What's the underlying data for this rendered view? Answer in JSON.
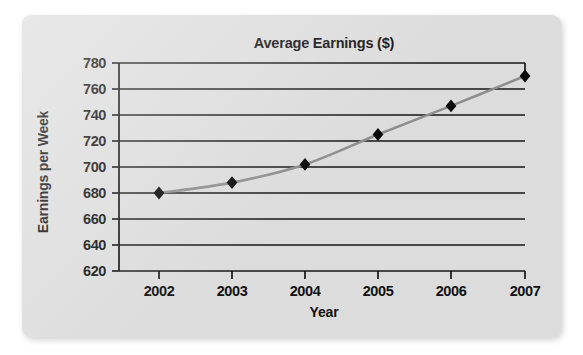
{
  "chart_data": {
    "type": "line",
    "title": "Average Earnings ($)",
    "xlabel": "Year",
    "ylabel": "Earnings per Week",
    "categories": [
      "2002",
      "2003",
      "2004",
      "2005",
      "2006",
      "2007"
    ],
    "x": [
      2002,
      2003,
      2004,
      2005,
      2006,
      2007
    ],
    "values": [
      680,
      688,
      702,
      725,
      747,
      770
    ],
    "series": [
      {
        "name": "Earnings per Week",
        "values": [
          680,
          688,
          702,
          725,
          747,
          770
        ]
      }
    ],
    "ylim": [
      620,
      780
    ],
    "yticks": [
      620,
      640,
      660,
      680,
      700,
      720,
      740,
      760,
      780
    ],
    "ytick_labels": [
      "620",
      "640",
      "660",
      "680",
      "700",
      "720",
      "740",
      "760",
      "780"
    ],
    "xtick_labels": [
      "2002",
      "2003",
      "2004",
      "2005",
      "2006",
      "2007"
    ],
    "grid": true,
    "grid_axis": "y",
    "legend": false,
    "legend_position": "none",
    "marker": "diamond",
    "marker_color": "#0b0b0b",
    "line_color": "#8e8e8e",
    "plot_background": "#dcdcdc"
  },
  "colors": {
    "page_background": "#ffffff",
    "card_background": "#dcdcdc",
    "axis": "#161616",
    "gridline": "#161616",
    "line": "#8e8e8e",
    "marker": "#0b0b0b",
    "text": "#111111"
  }
}
